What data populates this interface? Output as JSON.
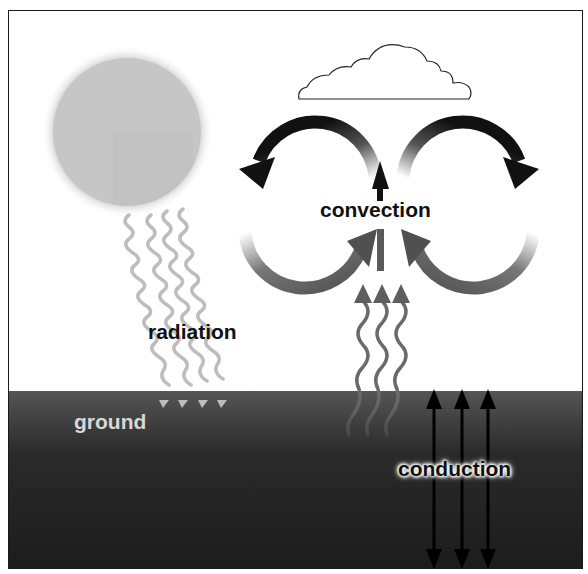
{
  "diagram": {
    "labels": {
      "convection": "convection",
      "radiation": "radiation",
      "ground": "ground",
      "conduction": "conduction"
    },
    "elements": {
      "sun": "sun-icon",
      "cloud": "cloud-icon",
      "convection_cells": 2,
      "radiation_waves_from_sun": 4,
      "heat_waves_from_ground": 3,
      "conduction_arrows": 3
    },
    "colors": {
      "ground_top": "#4a4a4a",
      "ground_bottom": "#1e1e1e",
      "sun_fill": "#c4c4c4",
      "arrow_dark": "#111111",
      "wave_light": "#bdbdbd",
      "wave_dark": "#6a6a6a",
      "frame": "#1a1a1a"
    }
  }
}
